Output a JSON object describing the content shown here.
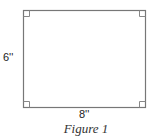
{
  "figure": {
    "caption": "Figure 1",
    "shape": "rectangle",
    "dimensions": {
      "height_label": "6''",
      "width_label": "8''"
    },
    "right_angle_markers": [
      "top-left",
      "top-right",
      "bottom-left",
      "bottom-right"
    ],
    "colors": {
      "stroke": "#777777",
      "marker": "#888888",
      "text": "#222222"
    }
  }
}
